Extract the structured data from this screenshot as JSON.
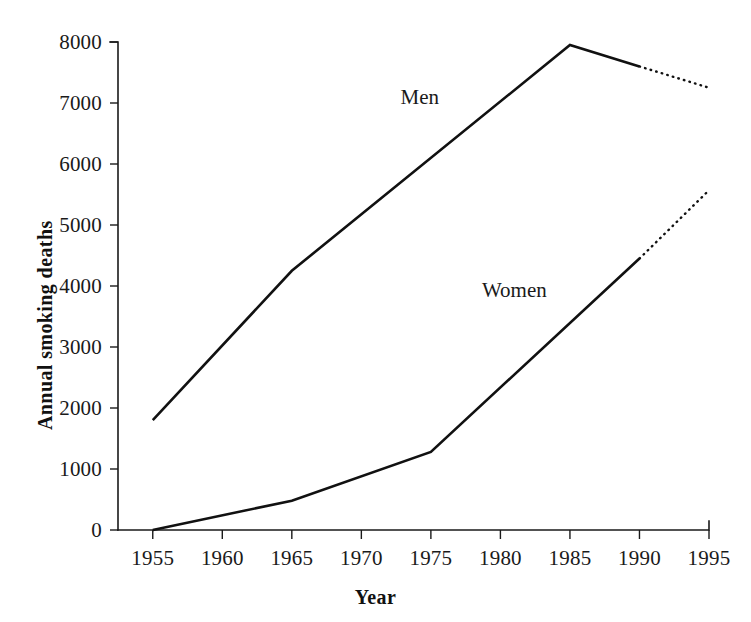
{
  "chart_data": {
    "type": "line",
    "title": "",
    "subtitle": "",
    "xlabel": "Year",
    "ylabel": "Annual smoking deaths",
    "xlim": [
      1952.5,
      1995
    ],
    "ylim": [
      0,
      8000
    ],
    "grid": false,
    "legend_position": "inline-labels",
    "x_ticks": [
      "1955",
      "1960",
      "1965",
      "1970",
      "1975",
      "1980",
      "1985",
      "1990",
      "1995"
    ],
    "x_tick_values": [
      1955,
      1960,
      1965,
      1970,
      1975,
      1980,
      1985,
      1990,
      1995
    ],
    "y_ticks": [
      "0",
      "1000",
      "2000",
      "3000",
      "4000",
      "5000",
      "6000",
      "7000",
      "8000"
    ],
    "y_tick_values": [
      0,
      1000,
      2000,
      3000,
      4000,
      5000,
      6000,
      7000,
      8000
    ],
    "series": [
      {
        "name": "Men",
        "style": "solid-with-dotted-projection",
        "label_x": 1974.2,
        "label_y": 7100,
        "x": [
          1955,
          1965,
          1985,
          1990
        ],
        "values": [
          1800,
          4250,
          7950,
          7600
        ],
        "projection_x": [
          1990,
          1995
        ],
        "projection_values": [
          7600,
          7250
        ]
      },
      {
        "name": "Women",
        "style": "solid-with-dotted-projection",
        "label_x": 1981.0,
        "label_y": 3930,
        "x": [
          1955,
          1965,
          1975,
          1990
        ],
        "values": [
          0,
          480,
          1280,
          4450
        ],
        "projection_x": [
          1990,
          1995
        ],
        "projection_values": [
          4450,
          5570
        ]
      }
    ],
    "colors": {
      "line": "#111111",
      "axis": "#1a1a1a",
      "background": "#ffffff"
    }
  }
}
